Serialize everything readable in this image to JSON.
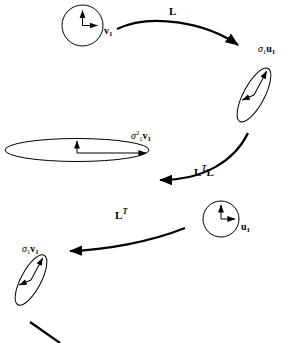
{
  "figure": {
    "background_color": "#ffffff",
    "stroke_color": "#000000",
    "width": 299,
    "height": 343
  },
  "shapes": {
    "unit_circle_top": {
      "name": "unit-circle-v",
      "kind": "circle",
      "cx": 82.5,
      "cy": 25.5,
      "r": 20.5,
      "arrows": [
        {
          "name": "up-arrow",
          "dx": 0,
          "dy": -18
        },
        {
          "name": "right-arrow",
          "dx": 18,
          "dy": 0
        }
      ]
    },
    "ellipse_sigma_u": {
      "name": "ellipse-sigma-u",
      "kind": "ellipse",
      "cx": 254,
      "cy": 95,
      "rx": 10,
      "ry": 30,
      "rotate": 28,
      "arrows": [
        {
          "name": "major-arrow",
          "length": 27
        },
        {
          "name": "minor-arrow",
          "length": 14
        }
      ]
    },
    "ellipse_sigma2_v": {
      "name": "ellipse-sigma-squared-v",
      "kind": "ellipse",
      "cx": 77,
      "cy": 150,
      "rx": 72,
      "ry": 12,
      "rotate": 0,
      "arrows": [
        {
          "name": "major-arrow",
          "length": 68
        },
        {
          "name": "minor-arrow",
          "length": 10
        }
      ]
    },
    "unit_circle_bottom": {
      "name": "unit-circle-u",
      "kind": "circle",
      "cx": 221,
      "cy": 219,
      "r": 18,
      "arrows": [
        {
          "name": "up-arrow",
          "dx": 0,
          "dy": -16
        },
        {
          "name": "right-arrow",
          "dx": 16,
          "dy": 0
        }
      ]
    },
    "ellipse_sigma_v": {
      "name": "ellipse-sigma-v",
      "kind": "ellipse",
      "cx": 31,
      "cy": 280,
      "rx": 10,
      "ry": 28,
      "rotate": 28,
      "arrows": [
        {
          "name": "major-arrow",
          "length": 25
        },
        {
          "name": "minor-arrow",
          "length": 13
        }
      ]
    }
  },
  "arrows": {
    "map_L": {
      "name": "arrow-L",
      "from": "unit_circle_top",
      "to": "ellipse_sigma_u",
      "direction": "right-down"
    },
    "map_LTL": {
      "name": "arrow-LTL",
      "from": "ellipse_sigma_u",
      "to": "ellipse_sigma2_v",
      "direction": "left-down"
    },
    "map_LT": {
      "name": "arrow-LT",
      "from": "unit_circle_bottom",
      "to": "ellipse_sigma_v",
      "direction": "left-down"
    },
    "partial_bottom": {
      "name": "arrow-partial-cropped",
      "direction": "left-down"
    }
  },
  "labels": {
    "v1": {
      "text": "v",
      "sub": "1",
      "full": "v₁"
    },
    "sigma1_u1": {
      "sigma": "σ",
      "sigma_sub": "1",
      "vec": "u",
      "vec_sub": "1",
      "full": "σ₁u₁"
    },
    "sigma1sq_v1": {
      "sigma": "σ",
      "sigma_sub": "1",
      "sigma_sup": "2",
      "vec": "v",
      "vec_sub": "1",
      "full": "σ₁²v₁"
    },
    "u1": {
      "text": "u",
      "sub": "1",
      "full": "u₁"
    },
    "sigma1_v1": {
      "sigma": "σ",
      "sigma_sub": "1",
      "vec": "v",
      "vec_sub": "1",
      "full": "σ₁v₁"
    },
    "op_L": {
      "text": "L",
      "sup": "",
      "full": "L"
    },
    "op_LTL": {
      "text": "L",
      "sup": "T",
      "tail": "L",
      "full": "LᵀL"
    },
    "op_LT": {
      "text": "L",
      "sup": "T",
      "tail": "",
      "full": "Lᵀ"
    }
  }
}
